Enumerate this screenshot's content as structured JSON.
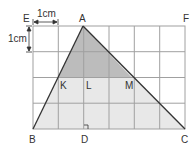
{
  "figure": {
    "grid": {
      "cols": 6,
      "rows": 4,
      "x0": 33,
      "y0": 26,
      "cell": 25.4
    },
    "colors": {
      "grid": "#9a9a9a",
      "triangle_fill": "#e6e6e6",
      "top_fill": "#bdbdbd",
      "line": "#333333"
    },
    "scale_labels": {
      "horizontal": "1cm",
      "vertical": "1cm"
    },
    "points": {
      "E": "E",
      "A": "A",
      "F": "F",
      "K": "K",
      "L": "L",
      "M": "M",
      "B": "B",
      "D": "D",
      "C": "C"
    }
  }
}
